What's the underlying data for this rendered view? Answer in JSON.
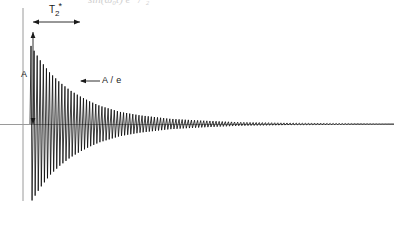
{
  "figure": {
    "kind": "free-induction-decay-plot",
    "background_color": "#ffffff",
    "axis_color": "#9a9a9a",
    "signal_color": "#000000",
    "annotation_color": "#1a1a1a",
    "width": 394,
    "height": 231
  },
  "axes": {
    "vertical_axis": {
      "x": 23,
      "y_top": 8,
      "y_bottom": 201
    },
    "horizontal_axis": {
      "y": 124,
      "x_left": 0,
      "x_right": 394
    },
    "grid": "off",
    "tick_labels": [],
    "xlabel": "",
    "ylabel": ""
  },
  "annotations": {
    "t2_star": {
      "base": "T",
      "subscript": "2",
      "superscript": "*",
      "full_text": "T2*",
      "arrow": {
        "x_start": 33,
        "x_end": 80,
        "y": 22,
        "heads": "both"
      }
    },
    "amplitude": {
      "label": "A",
      "arrow": {
        "x": 33,
        "y_top": 32,
        "y_bottom": 124,
        "heads": "both"
      }
    },
    "amplitude_over_e": {
      "label": "A / e",
      "leader": {
        "x_start": 100,
        "x_end": 80,
        "y": 81,
        "heads": "end"
      }
    },
    "top_clipped_fragment": "sin(ω₀t) e⁻ᵗ/ᵀ₂*"
  },
  "chart_data": {
    "type": "line",
    "title": "",
    "xlabel": "",
    "ylabel": "",
    "grid": false,
    "legend_position": "none",
    "signal_origin_x": 30,
    "baseline_y": 124,
    "amplitude_A": 92,
    "decay_constant_T2star_px": 47,
    "cycles_visible_estimate": 118,
    "samples_per_cycle": 3.0,
    "envelope_points": [
      {
        "x": 30,
        "upper_y": 32,
        "lower_y": 216
      },
      {
        "x": 40,
        "upper_y": 50,
        "lower_y": 198
      },
      {
        "x": 50,
        "upper_y": 65,
        "lower_y": 183
      },
      {
        "x": 60,
        "upper_y": 76,
        "lower_y": 172
      },
      {
        "x": 70,
        "upper_y": 85,
        "lower_y": 163
      },
      {
        "x": 80,
        "upper_y": 92,
        "lower_y": 156
      },
      {
        "x": 90,
        "upper_y": 98,
        "lower_y": 150
      },
      {
        "x": 100,
        "upper_y": 103,
        "lower_y": 145
      },
      {
        "x": 120,
        "upper_y": 110,
        "lower_y": 138
      },
      {
        "x": 140,
        "upper_y": 114,
        "lower_y": 134
      },
      {
        "x": 170,
        "upper_y": 118,
        "lower_y": 130
      },
      {
        "x": 200,
        "upper_y": 120,
        "lower_y": 128
      },
      {
        "x": 240,
        "upper_y": 122,
        "lower_y": 126
      },
      {
        "x": 300,
        "upper_y": 123,
        "lower_y": 125
      },
      {
        "x": 394,
        "upper_y": 124,
        "lower_y": 124
      }
    ],
    "ylim": [
      -100,
      100
    ],
    "xlim": [
      0,
      394
    ]
  }
}
